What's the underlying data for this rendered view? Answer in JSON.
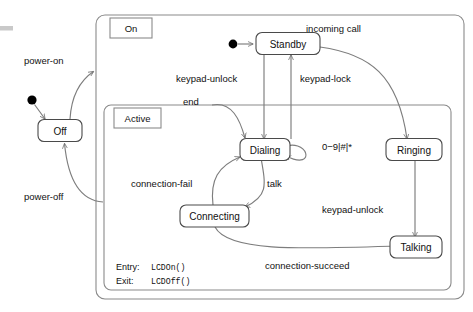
{
  "diagram": {
    "type": "uml-state-machine",
    "regions": [
      {
        "id": "on",
        "label": "On"
      },
      {
        "id": "active",
        "label": "Active"
      }
    ],
    "states": [
      {
        "id": "off",
        "label": "Off"
      },
      {
        "id": "standby",
        "label": "Standby"
      },
      {
        "id": "dialing",
        "label": "Dialing"
      },
      {
        "id": "ringing",
        "label": "Ringing"
      },
      {
        "id": "connecting",
        "label": "Connecting"
      },
      {
        "id": "talking",
        "label": "Talking"
      }
    ],
    "transitions": [
      {
        "id": "t-init-off",
        "from": "initial",
        "to": "off",
        "label": ""
      },
      {
        "id": "t-power-on",
        "from": "off",
        "to": "on",
        "label": "power-on"
      },
      {
        "id": "t-power-off",
        "from": "on",
        "to": "off",
        "label": "power-off"
      },
      {
        "id": "t-init-standby",
        "from": "initial",
        "to": "standby",
        "label": ""
      },
      {
        "id": "t-incoming-call",
        "from": "standby",
        "to": "ringing",
        "label": "incoming call"
      },
      {
        "id": "t-keypad-unlock",
        "from": "standby",
        "to": "dialing",
        "label": "keypad-unlock"
      },
      {
        "id": "t-keypad-lock",
        "from": "dialing",
        "to": "standby",
        "label": "keypad-lock"
      },
      {
        "id": "t-end",
        "from": "external",
        "to": "dialing",
        "label": "end"
      },
      {
        "id": "t-digits",
        "from": "dialing",
        "to": "dialing",
        "label": "0−9|#|*"
      },
      {
        "id": "t-talk",
        "from": "dialing",
        "to": "connecting",
        "label": "talk"
      },
      {
        "id": "t-connection-fail",
        "from": "connecting",
        "to": "dialing",
        "label": "connection-fail"
      },
      {
        "id": "t-connection-succeed",
        "from": "connecting",
        "to": "talking",
        "label": "connection-succeed"
      },
      {
        "id": "t-keypad-unlock-2",
        "from": "ringing",
        "to": "talking",
        "label": "keypad-unlock"
      }
    ],
    "actions": {
      "entry_label": "Entry:",
      "entry_value": "LCDOn()",
      "exit_label": "Exit:",
      "exit_value": "LCDOff()"
    },
    "colors": {
      "background": "#ffffff",
      "state_stroke": "#4a4a4a",
      "region_stroke": "#8a8a8a",
      "edge_stroke": "#7d7d7d",
      "text": "#111111",
      "initial_dot": "#000000"
    }
  }
}
